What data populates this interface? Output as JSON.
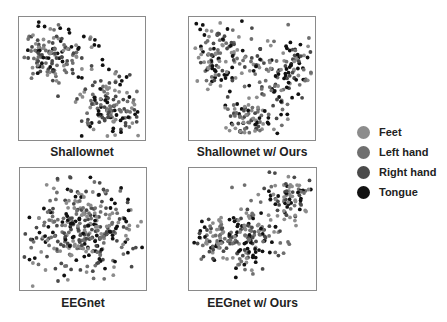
{
  "chart_data": [
    {
      "type": "scatter",
      "title": "Shallownet",
      "description": "t-SNE embedding; two loose clusters (upper-left, lower-right), classes mixed",
      "clusters": [
        {
          "cx": 0.28,
          "cy": 0.3,
          "sx": 0.15,
          "sy": 0.13,
          "n": 150
        },
        {
          "cx": 0.7,
          "cy": 0.72,
          "sx": 0.12,
          "sy": 0.14,
          "n": 150
        }
      ],
      "legend_ref": "legend"
    },
    {
      "type": "scatter",
      "title": "Shallownet w/ Ours",
      "description": "t-SNE embedding; arc-shaped arrangement with separated groups",
      "clusters": [
        {
          "cx": 0.25,
          "cy": 0.32,
          "sx": 0.13,
          "sy": 0.15,
          "n": 120
        },
        {
          "cx": 0.78,
          "cy": 0.45,
          "sx": 0.11,
          "sy": 0.16,
          "n": 110
        },
        {
          "cx": 0.48,
          "cy": 0.82,
          "sx": 0.12,
          "sy": 0.09,
          "n": 90
        },
        {
          "cx": 0.5,
          "cy": 0.35,
          "sx": 0.06,
          "sy": 0.05,
          "n": 15
        }
      ],
      "legend_ref": "legend"
    },
    {
      "type": "scatter",
      "title": "EEGnet",
      "description": "t-SNE embedding; single dense round blob, classes overlapping",
      "clusters": [
        {
          "cx": 0.52,
          "cy": 0.5,
          "sx": 0.2,
          "sy": 0.19,
          "n": 340
        }
      ],
      "legend_ref": "legend"
    },
    {
      "type": "scatter",
      "title": "EEGnet w/ Ours",
      "description": "t-SNE embedding; diagonal band from lower-left to upper-right",
      "clusters": [
        {
          "cx": 0.22,
          "cy": 0.58,
          "sx": 0.1,
          "sy": 0.1,
          "n": 80
        },
        {
          "cx": 0.48,
          "cy": 0.58,
          "sx": 0.12,
          "sy": 0.14,
          "n": 130
        },
        {
          "cx": 0.78,
          "cy": 0.22,
          "sx": 0.1,
          "sy": 0.1,
          "n": 90
        }
      ],
      "legend_ref": "legend"
    }
  ],
  "legend": [
    {
      "label": "Feet",
      "color": "#8c8c8c"
    },
    {
      "label": "Left hand",
      "color": "#6f6f6f"
    },
    {
      "label": "Right hand",
      "color": "#4a4a4a"
    },
    {
      "label": "Tongue",
      "color": "#111111"
    }
  ],
  "captions": [
    "Shallownet",
    "Shallownet w/ Ours",
    "EEGnet",
    "EEGnet w/ Ours"
  ],
  "grid": false,
  "axes_ticks": false
}
